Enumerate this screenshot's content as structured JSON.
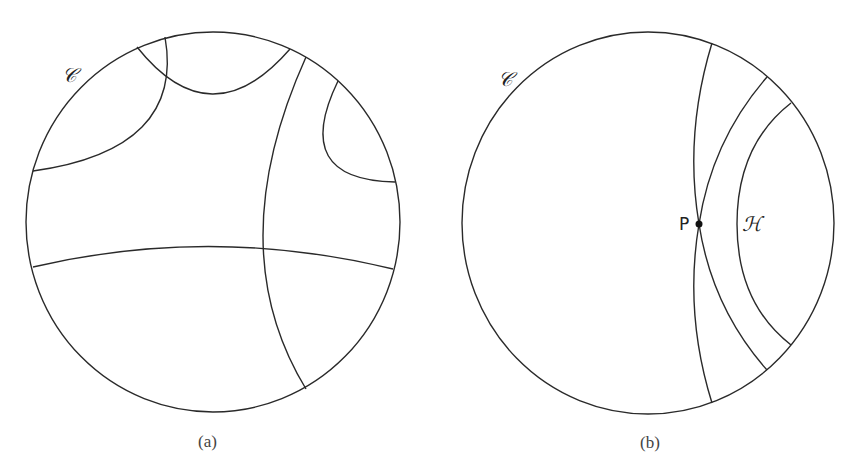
{
  "figure": {
    "panel_a": {
      "caption": "(a)",
      "circle_label": "𝒞",
      "description": "Poincaré disk with several hyperbolic lines (geodesic arcs orthogonal to boundary)"
    },
    "panel_b": {
      "caption": "(b)",
      "circle_label": "𝒞",
      "point_label": "P",
      "line_label": "ℋ",
      "description": "Poincaré disk showing a hyperbolic line H and two lines through point P not meeting H"
    },
    "colors": {
      "stroke": "#2a2a2a",
      "background": "#ffffff"
    }
  }
}
